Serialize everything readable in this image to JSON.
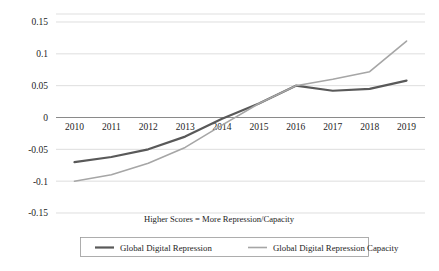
{
  "chart_data": {
    "type": "line",
    "title": "",
    "subtitle": "",
    "xlabel": "",
    "ylabel": "",
    "annotation": "Higher Scores = More Repression/Capacity",
    "x": [
      2010,
      2011,
      2012,
      2013,
      2014,
      2015,
      2016,
      2017,
      2018,
      2019
    ],
    "categories": [
      "2010",
      "2011",
      "2012",
      "2013",
      "2014",
      "2015",
      "2016",
      "2017",
      "2018",
      "2019"
    ],
    "ylim": [
      -0.15,
      0.15
    ],
    "yticks": [
      0.15,
      0.1,
      0.05,
      0,
      -0.05,
      -0.1,
      -0.15
    ],
    "ytick_labels": [
      "0.15",
      "0.1",
      "0.05",
      "0",
      "-0.05",
      "-0.1",
      "-0.15"
    ],
    "grid": true,
    "legend_position": "bottom",
    "series": [
      {
        "name": "Global Digital Repression",
        "color": "#595959",
        "width": 2.2,
        "values": [
          -0.07,
          -0.062,
          -0.05,
          -0.03,
          -0.002,
          0.022,
          0.05,
          0.042,
          0.045,
          0.058
        ]
      },
      {
        "name": "Global Digital Repression Capacity",
        "color": "#a6a6a6",
        "width": 1.6,
        "values": [
          -0.1,
          -0.09,
          -0.072,
          -0.047,
          -0.012,
          0.022,
          0.05,
          0.06,
          0.072,
          0.12
        ]
      }
    ]
  },
  "axis": {
    "note": "Higher Scores = More Repression/Capacity"
  },
  "legend": {
    "items": [
      {
        "label": "Global Digital Repression",
        "color": "#595959"
      },
      {
        "label": "Global Digital Repression Capacity",
        "color": "#a6a6a6"
      }
    ]
  }
}
